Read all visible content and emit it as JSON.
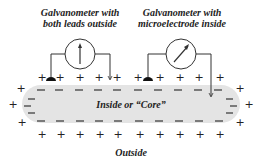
{
  "labels": {
    "galvanometer_left_line1": "Galvanometer with",
    "galvanometer_left_line2": "both leads outside",
    "galvanometer_right_line1": "Galvanometer with",
    "galvanometer_right_line2": "microelectrode inside",
    "core": "Inside or “Core”",
    "outside": "Outside"
  },
  "colors": {
    "core_fill": "#e4e4e4",
    "line": "#333333",
    "text": "#222222"
  },
  "charges": {
    "outer_sign": "+",
    "inner_sign": "–"
  },
  "galvanometers": [
    {
      "name": "both-leads-outside",
      "needle": "vertical (zero deflection)"
    },
    {
      "name": "microelectrode-inside",
      "needle": "deflected"
    }
  ]
}
